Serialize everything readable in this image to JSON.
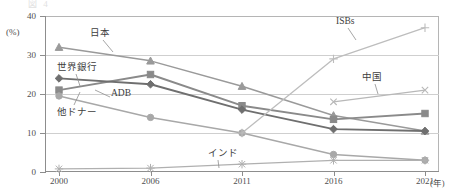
{
  "figure": {
    "cropped_title": "図  4                                                                                             ",
    "y_unit": "(%)",
    "x_unit": "(年)"
  },
  "axes": {
    "y_ticks": [
      "40",
      "30",
      "20",
      "10",
      "0"
    ],
    "x_ticks": [
      "2000",
      "2006",
      "2011",
      "2016",
      "2021"
    ]
  },
  "annotations": [
    {
      "name": "japan",
      "text": "日本"
    },
    {
      "name": "world-bank",
      "text": "世界銀行"
    },
    {
      "name": "adb",
      "text": "ADB"
    },
    {
      "name": "other-donor",
      "text": "他ドナー"
    },
    {
      "name": "india",
      "text": "インド"
    },
    {
      "name": "isbs",
      "text": "ISBs"
    },
    {
      "name": "china",
      "text": "中国"
    }
  ],
  "colors": {
    "japan": "#9a9a9a",
    "world_bank": "#8a8a8a",
    "adb": "#6f6f6f",
    "other_donor": "#a8a8a8",
    "india": "#b0b0b0",
    "isbs": "#bdbdbd",
    "china": "#b8b8b8",
    "grid": "#cfcfcf",
    "axis": "#8d8d8d",
    "text": "#4a4a4a"
  },
  "chart_data": {
    "type": "line",
    "title": "図 4",
    "xlabel": "(年)",
    "ylabel": "(%)",
    "ylim": [
      0,
      40
    ],
    "grid": true,
    "legend": "inline-annotations",
    "categories": [
      "2000",
      "2006",
      "2011",
      "2016",
      "2021"
    ],
    "series": [
      {
        "name": "日本",
        "marker": "triangle",
        "values": [
          32.0,
          28.5,
          22.0,
          14.5,
          10.5
        ]
      },
      {
        "name": "世界銀行",
        "marker": "square",
        "values": [
          21.0,
          25.0,
          17.0,
          13.5,
          15.0
        ]
      },
      {
        "name": "ADB",
        "marker": "diamond",
        "values": [
          24.0,
          22.5,
          16.0,
          11.0,
          10.5
        ]
      },
      {
        "name": "他ドナー",
        "marker": "circle",
        "values": [
          19.5,
          14.0,
          10.0,
          4.5,
          3.0
        ]
      },
      {
        "name": "インド",
        "marker": "star",
        "values": [
          0.8,
          1.0,
          2.0,
          3.0,
          3.0
        ]
      },
      {
        "name": "ISBs",
        "marker": "plus",
        "values": [
          null,
          null,
          10.0,
          29.0,
          37.0
        ]
      },
      {
        "name": "中国",
        "marker": "cross",
        "values": [
          null,
          null,
          null,
          18.0,
          21.0
        ]
      }
    ]
  }
}
